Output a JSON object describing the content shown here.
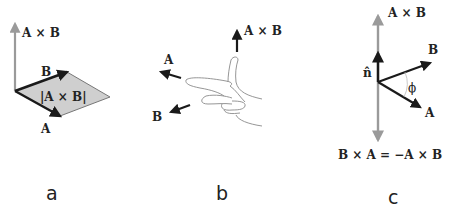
{
  "figure": {
    "panels": [
      {
        "id": "a",
        "caption": "a",
        "labels": {
          "cross": "A × B",
          "vector_a": "A",
          "vector_b": "B",
          "area": "|A × B|"
        }
      },
      {
        "id": "b",
        "caption": "b",
        "labels": {
          "cross": "A × B",
          "vector_a": "A",
          "vector_b": "B"
        }
      },
      {
        "id": "c",
        "caption": "c",
        "labels": {
          "cross": "A × B",
          "vector_a": "A",
          "vector_b": "B",
          "unit_normal": "n̂",
          "angle": "ϕ",
          "equation": "B × A = −A × B"
        }
      }
    ],
    "colors": {
      "vector": "#1a1a1a",
      "cross_axis": "#9a9a9a",
      "parallelogram_fill": "#cfcfcf",
      "hand_outline": "#8a8a8a"
    }
  }
}
